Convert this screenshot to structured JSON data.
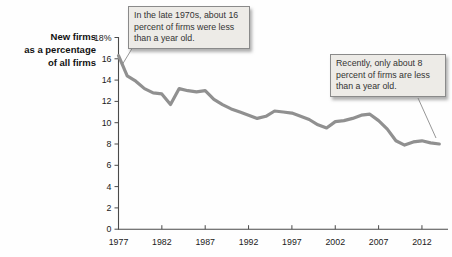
{
  "chart_data": {
    "type": "line",
    "title": "",
    "ylabel_lines": [
      "New firms",
      "as a percentage",
      "of all firms"
    ],
    "x_start": 1977,
    "x_step": 1,
    "values": [
      16.3,
      14.4,
      13.9,
      13.2,
      12.8,
      12.7,
      11.7,
      13.2,
      13.0,
      12.9,
      13.0,
      12.2,
      11.7,
      11.3,
      11.0,
      10.7,
      10.4,
      10.6,
      11.1,
      11.0,
      10.9,
      10.6,
      10.3,
      9.8,
      9.5,
      10.1,
      10.2,
      10.4,
      10.7,
      10.8,
      10.2,
      9.4,
      8.3,
      7.9,
      8.2,
      8.3,
      8.1,
      8.0
    ],
    "x_ticks": [
      1977,
      1982,
      1987,
      1992,
      1997,
      2002,
      2007,
      2012
    ],
    "y_ticks": [
      0,
      2,
      4,
      6,
      8,
      10,
      12,
      14,
      16,
      18
    ],
    "y_tick_labels": [
      "0",
      "2",
      "4",
      "6",
      "8",
      "10",
      "12",
      "14",
      "16",
      "18%"
    ],
    "ylim": [
      0,
      18
    ],
    "xlim": [
      1977,
      2014.5
    ],
    "grid": false,
    "legend": "none",
    "line_color": "#909090",
    "axis_color": "#4a4a4a",
    "label_color": "#1a1a1a",
    "annotations": [
      {
        "text": "In the late 1970s, about 16 percent of firms were less than a year old."
      },
      {
        "text": "Recently, only about 8 percent of firms are less than a year old."
      }
    ]
  }
}
